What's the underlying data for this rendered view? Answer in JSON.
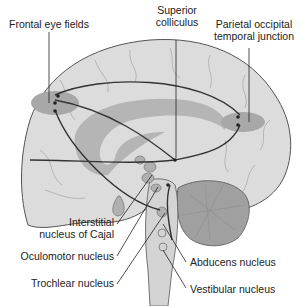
{
  "figure": {
    "type": "sagittal brain diagram",
    "colors": {
      "brain_fill": "#dcdcdc",
      "outline": "#555555",
      "region_highlight": "#a8a8a8",
      "ventricle": "#b5b5b5",
      "cerebellum": "#a0a0a0",
      "pathway": "#333333",
      "background": "#ffffff"
    }
  },
  "labels": {
    "frontal_eye_fields": "Frontal eye fields",
    "superior_colliculus_line1": "Superior",
    "superior_colliculus_line2": "colliculus",
    "parietal_line1": "Parietal occipital",
    "parietal_line2": "temporal junction",
    "interstitial_line1": "Interstitial",
    "interstitial_line2": "nucleus of Cajal",
    "oculomotor": "Oculomotor nucleus",
    "trochlear": "Trochlear nucleus",
    "abducens": "Abducens nucleus",
    "vestibular": "Vestibular nucleus"
  }
}
